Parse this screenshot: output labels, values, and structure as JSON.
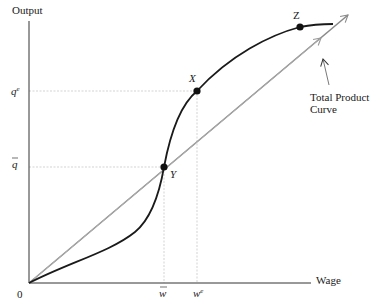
{
  "diagram": {
    "axes": {
      "y_label": "Output",
      "x_label": "Wage",
      "origin_label": "0"
    },
    "y_ticks": {
      "qe": "q",
      "qe_sup": "e",
      "qbar": "q"
    },
    "x_ticks": {
      "wbar": "w",
      "we": "w",
      "we_sup": "e"
    },
    "points": {
      "X": "X",
      "Y": "Y",
      "Z": "Z"
    },
    "curve_label_line1": "Total Product",
    "curve_label_line2": "Curve",
    "colors": {
      "curve": "#1a1a1a",
      "ray_steep": "#8a8a8a",
      "ray_shallow": "#b0b0b0",
      "guides": "#c8c8c8",
      "axis": "#333333"
    }
  }
}
